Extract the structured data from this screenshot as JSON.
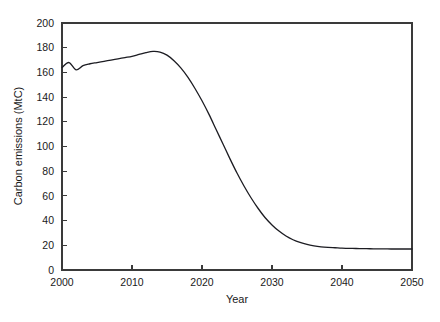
{
  "chart_data": {
    "type": "line",
    "title": "",
    "xlabel": "Year",
    "ylabel": "Carbon emissions (MtC)",
    "xlim": [
      2000,
      2050
    ],
    "ylim": [
      0,
      200
    ],
    "xticks": [
      2000,
      2010,
      2020,
      2030,
      2040,
      2050
    ],
    "xticklabels": [
      "2000",
      "2010",
      "2020",
      "2030",
      "2040",
      "2050"
    ],
    "yticks": [
      0,
      20,
      40,
      60,
      80,
      100,
      120,
      140,
      160,
      180,
      200
    ],
    "yticklabels": [
      "0",
      "20",
      "40",
      "60",
      "80",
      "100",
      "120",
      "140",
      "160",
      "180",
      "200"
    ],
    "grid": false,
    "legend": false,
    "legend_position": "none",
    "line_color": "#1c1c22",
    "frame_color": "#3a3a3a",
    "background_color": "#ffffff",
    "x": [
      2000,
      2001,
      2002,
      2003,
      2004,
      2005,
      2006,
      2007,
      2008,
      2009,
      2010,
      2011,
      2012,
      2013,
      2014,
      2015,
      2016,
      2017,
      2018,
      2019,
      2020,
      2021,
      2022,
      2023,
      2024,
      2025,
      2026,
      2027,
      2028,
      2029,
      2030,
      2031,
      2032,
      2033,
      2034,
      2035,
      2036,
      2037,
      2038,
      2039,
      2040,
      2041,
      2042,
      2043,
      2044,
      2045,
      2046,
      2047,
      2048,
      2049,
      2050
    ],
    "series": [
      {
        "name": "Carbon emissions",
        "color": "#1c1c22",
        "values": [
          164.0,
          168.0,
          162.0,
          165.5,
          167.0,
          168.0,
          169.0,
          170.0,
          171.0,
          172.0,
          173.0,
          174.5,
          176.0,
          177.0,
          176.5,
          174.0,
          169.5,
          163.5,
          156.0,
          147.0,
          137.0,
          126.0,
          114.0,
          102.0,
          90.0,
          78.5,
          68.0,
          58.5,
          50.0,
          42.5,
          36.5,
          31.5,
          27.5,
          24.5,
          22.3,
          20.7,
          19.6,
          18.8,
          18.3,
          18.0,
          17.7,
          17.5,
          17.4,
          17.3,
          17.2,
          17.1,
          17.1,
          17.0,
          17.0,
          17.0,
          17.0
        ]
      }
    ],
    "annotations": []
  },
  "figure": {
    "axis": {
      "y_title": "Carbon emissions (MtC)",
      "x_title": "Year"
    }
  }
}
